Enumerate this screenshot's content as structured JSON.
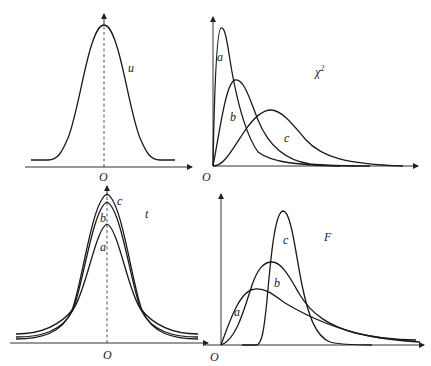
{
  "panels": {
    "normal": {
      "label": "u",
      "origin": "O",
      "curves": []
    },
    "chi_square": {
      "label": "χ",
      "label_sup": "2",
      "origin": "O",
      "curves": [
        {
          "name": "a"
        },
        {
          "name": "b"
        },
        {
          "name": "c"
        }
      ]
    },
    "t": {
      "label": "t",
      "origin": "O",
      "curves": [
        {
          "name": "a"
        },
        {
          "name": "b"
        },
        {
          "name": "c"
        }
      ]
    },
    "f": {
      "label": "F",
      "origin": "O",
      "curves": [
        {
          "name": "a"
        },
        {
          "name": "b"
        },
        {
          "name": "c"
        }
      ]
    }
  },
  "colors": {
    "line": "#1a1a1a",
    "background": "#ffffff"
  }
}
